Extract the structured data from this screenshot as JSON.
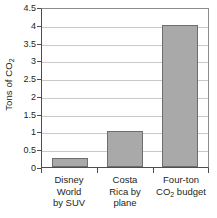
{
  "chart_data": {
    "type": "bar",
    "title": "",
    "xlabel": "",
    "ylabel": "Tons of CO2",
    "ylabel_display": "Tons of CO",
    "ylabel_subscript": "2",
    "categories": [
      "Disney World by SUV",
      "Costa Rica by plane",
      "Four-ton CO2 budget"
    ],
    "category_lines": [
      [
        "Disney",
        "World",
        "by SUV"
      ],
      [
        "Costa",
        "Rica by",
        "plane"
      ],
      [
        "Four-ton",
        "CO2 budget"
      ]
    ],
    "values": [
      0.25,
      1,
      4
    ],
    "ylim": [
      0,
      4.5
    ],
    "ytick_labels": [
      "0",
      "0.5",
      "1",
      "1.5",
      "2",
      "2.5",
      "3",
      "3.5",
      "4",
      "4.5"
    ],
    "ytick_values": [
      0,
      0.5,
      1,
      1.5,
      2,
      2.5,
      3,
      3.5,
      4,
      4.5
    ],
    "grid": true,
    "grid_orientation": "horizontal",
    "legend": "none",
    "bar_color": "#a9a9a9",
    "bar_border_color": "#6e6e6e",
    "axis_color": "#4d4d4d",
    "grid_color": "#c9c9c9",
    "background_color": "#ffffff",
    "text_color": "#231f20"
  }
}
